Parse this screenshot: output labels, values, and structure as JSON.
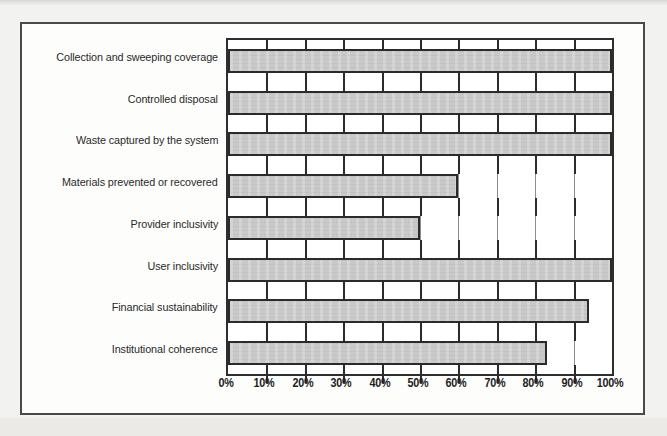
{
  "figure": {
    "kind": "horizontal-bar-chart",
    "border_color": "#4a4a4a",
    "background_color": "#fdfdfc",
    "page_background": "#f2f2f0"
  },
  "chart_data": {
    "type": "bar",
    "orientation": "horizontal",
    "title": "",
    "subtitle": "",
    "xlabel": "",
    "ylabel": "",
    "categories": [
      "Collection and sweeping coverage",
      "Controlled disposal",
      "Waste captured by the system",
      "Materials prevented or recovered",
      "Provider inclusivity",
      "User inclusivity",
      "Financial sustainability",
      "Institutional coherence"
    ],
    "values": [
      100,
      100,
      100,
      60,
      50,
      100,
      94,
      83
    ],
    "value_suffix": "%",
    "xlim": [
      0,
      100
    ],
    "xticks": [
      0,
      10,
      20,
      30,
      40,
      50,
      60,
      70,
      80,
      90,
      100
    ],
    "xtick_labels": [
      "0%",
      "10%",
      "20%",
      "30%",
      "40%",
      "50%",
      "60%",
      "70%",
      "80%",
      "90%",
      "100%"
    ],
    "grid": true,
    "grid_axis": "x",
    "legend": false,
    "legend_position": "none",
    "series": [
      {
        "name": "Score",
        "values": [
          100,
          100,
          100,
          60,
          50,
          100,
          94,
          83
        ],
        "bar_fill_color": "#c9c9c9",
        "bar_edge_color": "#2b2b2b"
      }
    ],
    "annotations": []
  },
  "axis": {
    "gridline_color": "#8d8d8d",
    "frame_color": "#2e2e2e"
  }
}
